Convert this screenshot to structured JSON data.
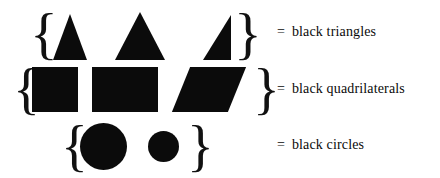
{
  "figure": {
    "background_color": "#ffffff",
    "ink_color": "#0b0b0b",
    "brace_open": "{",
    "brace_close": "}",
    "equals_sign": "=",
    "rows": [
      {
        "id": "triangles",
        "label": "black triangles",
        "shapes": [
          {
            "name": "isosceles-triangle-narrow",
            "kind": "triangle"
          },
          {
            "name": "isosceles-triangle-wide",
            "kind": "triangle"
          },
          {
            "name": "right-triangle",
            "kind": "triangle"
          }
        ]
      },
      {
        "id": "quadrilaterals",
        "label": "black quadrilaterals",
        "shapes": [
          {
            "name": "square",
            "kind": "quadrilateral"
          },
          {
            "name": "rectangle",
            "kind": "quadrilateral"
          },
          {
            "name": "parallelogram",
            "kind": "quadrilateral"
          }
        ]
      },
      {
        "id": "circles",
        "label": "black circles",
        "shapes": [
          {
            "name": "circle-large",
            "kind": "circle"
          },
          {
            "name": "circle-small",
            "kind": "circle"
          }
        ]
      }
    ]
  }
}
